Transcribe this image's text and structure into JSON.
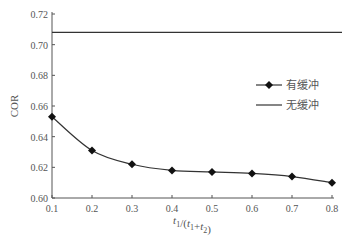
{
  "chart_data": {
    "type": "line",
    "title": "",
    "xlabel": "t1/(t1+t2)",
    "ylabel": "COR",
    "xlim": [
      0.1,
      0.8
    ],
    "ylim": [
      0.6,
      0.72
    ],
    "x_ticks": [
      "0.1",
      "0.2",
      "0.3",
      "0.4",
      "0.5",
      "0.6",
      "0.7",
      "0.8"
    ],
    "y_ticks": [
      "0.60",
      "0.62",
      "0.64",
      "0.66",
      "0.68",
      "0.70",
      "0.72"
    ],
    "grid": false,
    "legend_position": "right-middle",
    "x": [
      0.1,
      0.2,
      0.3,
      0.4,
      0.5,
      0.6,
      0.7,
      0.8
    ],
    "series": [
      {
        "name": "有缓冲",
        "marker": "diamond",
        "values": [
          0.653,
          0.631,
          0.622,
          0.618,
          0.617,
          0.616,
          0.614,
          0.61
        ]
      },
      {
        "name": "无缓冲",
        "marker": "none",
        "values": [
          0.708,
          0.708,
          0.708,
          0.708,
          0.708,
          0.708,
          0.708,
          0.708
        ]
      }
    ]
  },
  "colors": {
    "line": "#333333",
    "axis": "#555555",
    "text": "#555555"
  }
}
